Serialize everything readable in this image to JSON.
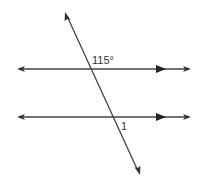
{
  "diagram": {
    "type": "parallel-lines-transversal",
    "labels": {
      "given_angle": "115°",
      "unknown_angle": "1"
    },
    "colors": {
      "line": "#333333",
      "background": "#ffffff"
    }
  }
}
